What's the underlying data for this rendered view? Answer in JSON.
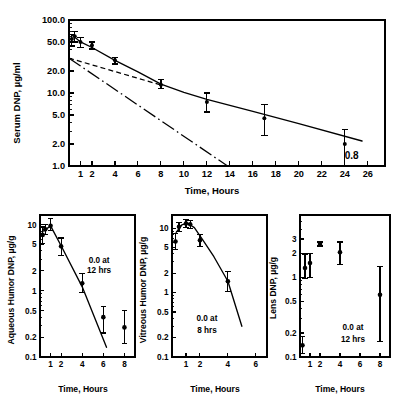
{
  "figure": {
    "title": "",
    "panel_count": 4
  },
  "chart_data": [
    {
      "id": "serum",
      "type": "scatter",
      "title": "",
      "xlabel": "Time, Hours",
      "ylabel": "Serum DNP, µg/ml",
      "xscale": "linear",
      "yscale": "log",
      "xlim": [
        0,
        27.5
      ],
      "ylim": [
        1.0,
        100.0
      ],
      "grid": false,
      "legend": "none",
      "xticks": [
        1,
        2,
        4,
        6,
        8,
        10,
        12,
        14,
        16,
        18,
        20,
        22,
        24,
        26
      ],
      "xticklabels": [
        "1",
        "2",
        "4",
        "6",
        "8",
        "10",
        "12",
        "14",
        "16",
        "18",
        "20",
        "22",
        "24",
        "26"
      ],
      "yticks": [
        1.0,
        2.0,
        5.0,
        10.0,
        20.0,
        50.0,
        100.0
      ],
      "yticklabels": [
        "1.0",
        "2.0",
        "5.0",
        "10.0",
        "20.0",
        "50.0",
        "100.0"
      ],
      "series": [
        {
          "name": "Serum DNP observed",
          "style": "points-with-error-bars",
          "x": [
            0.25,
            0.5,
            1.0,
            2.0,
            4.0,
            8.0,
            12.0,
            17.0,
            24.0
          ],
          "y": [
            55.0,
            60.0,
            50.0,
            45.0,
            28.0,
            13.0,
            7.5,
            4.5,
            2.0
          ],
          "yerr_low": [
            44.0,
            50.0,
            42.0,
            40.0,
            25.0,
            11.5,
            5.5,
            2.6,
            0.8
          ],
          "yerr_high": [
            64.0,
            70.0,
            58.0,
            50.0,
            31.0,
            15.5,
            10.0,
            7.0,
            3.2
          ]
        },
        {
          "name": "Fitted biexponential curve",
          "style": "solid-line",
          "x": [
            0.3,
            1.0,
            2.0,
            4.0,
            6.0,
            8.0,
            10.0,
            12.0,
            16.0,
            20.0,
            25.5
          ],
          "y": [
            62.0,
            50.0,
            42.0,
            28.0,
            19.5,
            13.2,
            10.2,
            8.2,
            5.6,
            3.8,
            2.2
          ]
        },
        {
          "name": "Terminal phase extrapolation",
          "style": "dashed-line",
          "x": [
            0.0,
            8.2
          ],
          "y": [
            30.0,
            12.6
          ]
        },
        {
          "name": "Distribution phase residual",
          "style": "dash-dot-line",
          "x": [
            0.0,
            13.8
          ],
          "y": [
            30.0,
            1.0
          ]
        }
      ],
      "annotations": [
        {
          "text": "0.8",
          "x": 24.0,
          "y": 1.25,
          "note": "lower error bound label at 24 hours"
        }
      ]
    },
    {
      "id": "aqueous-humor",
      "type": "scatter",
      "title": "",
      "xlabel": "Time, Hours",
      "ylabel": "Aqueous Humor DNP, µg/g",
      "xscale": "linear",
      "yscale": "log",
      "xlim": [
        0,
        9.0
      ],
      "ylim": [
        0.1,
        14.0
      ],
      "grid": false,
      "legend": "none",
      "xticks": [
        1,
        2,
        4,
        6,
        8
      ],
      "xticklabels": [
        "1",
        "2",
        "4",
        "6",
        "8"
      ],
      "yticks": [
        0.1,
        0.2,
        0.5,
        1.0,
        2.0,
        5.0,
        10.0
      ],
      "yticklabels": [
        "0.1",
        "0.2",
        "0.5",
        "1",
        "2",
        "5",
        "10"
      ],
      "series": [
        {
          "name": "Aqueous humor DNP observed",
          "style": "points-with-error-bars",
          "x": [
            0.25,
            0.5,
            1.0,
            2.0,
            4.0,
            6.0,
            8.0
          ],
          "y": [
            7.0,
            8.5,
            9.6,
            4.7,
            1.3,
            0.4,
            0.28
          ],
          "yerr_low": [
            5.2,
            7.0,
            8.2,
            3.4,
            0.95,
            0.23,
            0.16
          ],
          "yerr_high": [
            9.2,
            10.0,
            12.5,
            6.3,
            1.85,
            0.58,
            0.5
          ]
        },
        {
          "name": "Fitted decline",
          "style": "solid-line",
          "x": [
            0.35,
            1.0,
            2.0,
            4.0,
            6.3
          ],
          "y": [
            8.0,
            9.6,
            4.8,
            1.15,
            0.14
          ]
        }
      ],
      "annotations": [
        {
          "text": "0.0 at",
          "x": 5.6,
          "y": 2.6,
          "note": "annotation line 1"
        },
        {
          "text": "12 hrs",
          "x": 5.6,
          "y": 1.85,
          "note": "annotation line 2"
        }
      ]
    },
    {
      "id": "vitreous-humor",
      "type": "scatter",
      "title": "",
      "xlabel": "Time, Hours",
      "ylabel": "Vitreous Humor DNP, µg/g",
      "xscale": "linear",
      "yscale": "log",
      "xlim": [
        0,
        6.8
      ],
      "ylim": [
        0.1,
        16.0
      ],
      "grid": false,
      "legend": "none",
      "xticks": [
        1,
        2,
        4,
        6
      ],
      "xticklabels": [
        "1",
        "2",
        "4",
        "6"
      ],
      "yticks": [
        0.1,
        0.2,
        0.5,
        1.0,
        2.0,
        5.0,
        10.0
      ],
      "yticklabels": [
        "0.1",
        "0.2",
        "0.5",
        "1",
        "2",
        "5",
        "10"
      ],
      "series": [
        {
          "name": "Vitreous humor DNP observed",
          "style": "points-with-error-bars",
          "x": [
            0.25,
            0.5,
            1.0,
            1.3,
            2.0,
            4.0
          ],
          "y": [
            6.2,
            10.5,
            11.8,
            11.5,
            6.5,
            1.5
          ],
          "yerr_low": [
            4.6,
            9.0,
            10.3,
            10.0,
            5.2,
            1.05
          ],
          "yerr_high": [
            8.2,
            12.2,
            13.5,
            13.2,
            8.0,
            2.15
          ]
        },
        {
          "name": "Fitted rise and decline",
          "style": "solid-line",
          "x": [
            0.3,
            0.7,
            1.1,
            1.6,
            2.2,
            3.0,
            4.0,
            5.0
          ],
          "y": [
            8.6,
            11.2,
            12.0,
            10.2,
            6.6,
            3.6,
            1.5,
            0.3
          ]
        }
      ],
      "annotations": [
        {
          "text": "0.0 at",
          "x": 2.5,
          "y": 0.36,
          "note": "annotation line 1"
        },
        {
          "text": "8 hrs",
          "x": 2.5,
          "y": 0.24,
          "note": "annotation line 2"
        }
      ]
    },
    {
      "id": "lens",
      "type": "scatter",
      "title": "",
      "xlabel": "Time, Hours",
      "ylabel": "Lens DNP, µg/g",
      "xscale": "linear",
      "yscale": "log",
      "xlim": [
        0,
        9.0
      ],
      "ylim": [
        0.1,
        6.0
      ],
      "grid": false,
      "legend": "none",
      "xticks": [
        1,
        2,
        4,
        6,
        8
      ],
      "xticklabels": [
        "1",
        "2",
        "4",
        "6",
        "8"
      ],
      "yticks": [
        0.1,
        0.2,
        0.5,
        1.0,
        2.0,
        3.0
      ],
      "yticklabels": [
        "0.1",
        "0.2",
        "0.5",
        "1",
        "2",
        "3"
      ],
      "series": [
        {
          "name": "Lens DNP observed",
          "style": "points-with-error-bars",
          "x": [
            0.25,
            0.5,
            1.0,
            2.0,
            4.0,
            8.0
          ],
          "y": [
            0.14,
            1.3,
            1.5,
            2.6,
            2.05,
            0.6
          ],
          "yerr_low": [
            0.11,
            0.95,
            0.98,
            2.45,
            1.45,
            0.155
          ],
          "yerr_high": [
            0.18,
            1.95,
            2.0,
            2.75,
            2.75,
            1.35
          ]
        }
      ],
      "annotations": [
        {
          "text": "0.0 at",
          "x": 5.3,
          "y": 0.22,
          "note": "annotation line 1"
        },
        {
          "text": "12 hrs",
          "x": 5.3,
          "y": 0.155,
          "note": "annotation line 2"
        }
      ]
    }
  ]
}
